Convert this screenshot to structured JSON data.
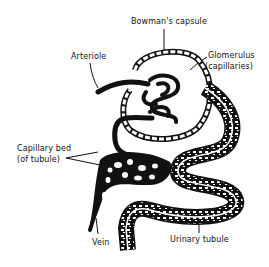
{
  "diagram": {
    "type": "anatomical-illustration",
    "labels": {
      "bowmans_capsule": "Bowman's capsule",
      "arteriole": "Arteriole",
      "glomerulus_line1": "Glomerulus",
      "glomerulus_line2": "(capillaries)",
      "capillary_bed_line1": "Capillary bed",
      "capillary_bed_line2": "(of tubule)",
      "vein": "Vein",
      "urinary_tubule": "Urinary tubule"
    },
    "colors": {
      "ink": "#111111",
      "background": "#ffffff"
    }
  }
}
